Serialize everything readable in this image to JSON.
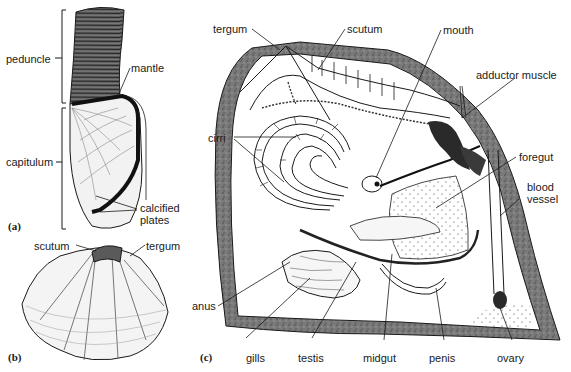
{
  "figure": {
    "panels": [
      {
        "id": "a",
        "tag": "(a)",
        "labels": {
          "peduncle": "peduncle",
          "mantle": "mantle",
          "capitulum": "capitulum",
          "calcified_plates_1": "calcified",
          "calcified_plates_2": "plates"
        }
      },
      {
        "id": "b",
        "tag": "(b)",
        "labels": {
          "scutum": "scutum",
          "tergum": "tergum"
        }
      },
      {
        "id": "c",
        "tag": "(c)",
        "labels": {
          "tergum": "tergum",
          "scutum": "scutum",
          "mouth": "mouth",
          "adductor_muscle": "adductor muscle",
          "cirri": "cirri",
          "foregut": "foregut",
          "blood_vessel_1": "blood",
          "blood_vessel_2": "vessel",
          "anus": "anus",
          "gills": "gills",
          "testis": "testis",
          "midgut": "midgut",
          "penis": "penis",
          "ovary": "ovary"
        }
      }
    ]
  },
  "colors": {
    "ink": "#1a1a1a",
    "shell_fill": "#6e6e6e",
    "paper": "#ffffff"
  }
}
